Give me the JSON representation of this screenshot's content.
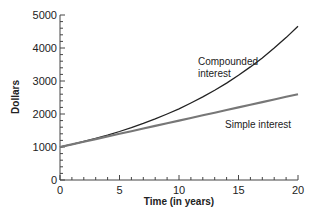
{
  "chart_data": {
    "type": "line",
    "title": "",
    "xlabel": "Time (in years)",
    "ylabel": "Dollars",
    "xlim": [
      0,
      20
    ],
    "ylim": [
      0,
      5000
    ],
    "x_ticks": [
      0,
      5,
      10,
      15,
      20
    ],
    "y_ticks": [
      0,
      1000,
      2000,
      3000,
      4000,
      5000
    ],
    "grid": false,
    "legend": "none (inline annotations)",
    "x": [
      0,
      1,
      2,
      3,
      4,
      5,
      6,
      7,
      8,
      9,
      10,
      11,
      12,
      13,
      14,
      15,
      16,
      17,
      18,
      19,
      20
    ],
    "series": [
      {
        "name": "Compounded interest",
        "color": "#222222",
        "values": [
          1000,
          1080,
          1166,
          1260,
          1360,
          1469,
          1587,
          1714,
          1851,
          1999,
          2159,
          2332,
          2518,
          2720,
          2937,
          3172,
          3426,
          3700,
          3996,
          4316,
          4661
        ]
      },
      {
        "name": "Simple interest",
        "color": "#777777",
        "values": [
          1000,
          1080,
          1160,
          1240,
          1320,
          1400,
          1480,
          1560,
          1640,
          1720,
          1800,
          1880,
          1960,
          2040,
          2120,
          2200,
          2280,
          2360,
          2440,
          2520,
          2600
        ]
      }
    ],
    "annotations": [
      {
        "text_line1": "Compounded",
        "text_line2": "interest",
        "x": 11.5,
        "y": 3300
      },
      {
        "text_line1": "Simple interest",
        "x": 13,
        "y": 1500
      }
    ]
  }
}
